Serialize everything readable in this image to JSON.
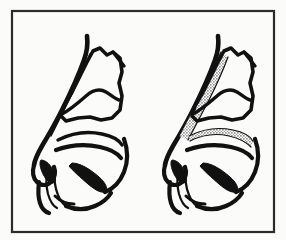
{
  "figure": {
    "title": "Sagittal nasal anatomy, two-panel comparison",
    "border_color": "#2b2b2b",
    "background_color": "#fbfbf9",
    "ink_color": "#111111",
    "graft_stipple_color": "#8a8a8a",
    "frame": {
      "x": 12,
      "y": 11,
      "width": 262,
      "height": 221
    },
    "panels": [
      {
        "id": "left",
        "data_name": "panel-left",
        "label": "",
        "caption": "",
        "has_graft": false,
        "grafts": []
      },
      {
        "id": "right",
        "data_name": "panel-right",
        "label": "",
        "caption": "",
        "has_graft": true,
        "grafts": [
          {
            "name": "dorsal-onlay-graft",
            "style": "stippled-band",
            "orientation": "oblique-dorsal"
          },
          {
            "name": "floor-graft",
            "style": "stippled-band",
            "orientation": "horizontal-floor"
          }
        ]
      }
    ],
    "structures": [
      {
        "name": "nasal-dorsum-line"
      },
      {
        "name": "septal-cartilage-outline"
      },
      {
        "name": "upper-lateral-spur"
      },
      {
        "name": "inferior-turbinate"
      },
      {
        "name": "middle-turbinate"
      },
      {
        "name": "nasal-tip"
      },
      {
        "name": "columella"
      },
      {
        "name": "nostril-sill"
      },
      {
        "name": "upper-lip-contour"
      },
      {
        "name": "nasopharynx-curve"
      },
      {
        "name": "palate-line"
      }
    ]
  }
}
